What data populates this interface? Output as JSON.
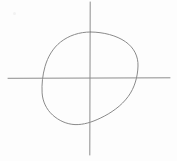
{
  "figure": {
    "title": "Circle intersected by horizontal and vertical axis lines",
    "canvas": {
      "width": 177,
      "height": 161,
      "background_color": "#fdfdfd"
    },
    "stroke": {
      "circle_color": "#8a8a8a",
      "axis_color": "#8d8d8d",
      "circle_width": 1,
      "axis_width": 1
    },
    "elements": {
      "circle": {
        "label": "circle",
        "center_x": 90,
        "center_y": 78.5,
        "radius_x": 48,
        "radius_y": 46.5,
        "left_x": 42,
        "right_x": 138,
        "top_y": 32,
        "bottom_y": 125
      },
      "vertical_line": {
        "label": "vertical axis line",
        "x": 90,
        "y_start": 2,
        "y_end": 155
      },
      "horizontal_line": {
        "label": "horizontal axis line",
        "y": 78,
        "x_start": 8,
        "x_end": 170
      },
      "intersection": {
        "label": "axes intersection point",
        "x": 90,
        "y": 78
      }
    },
    "artifacts": [
      {
        "name": "paper-speck",
        "x": 13,
        "y": 12
      }
    ]
  }
}
